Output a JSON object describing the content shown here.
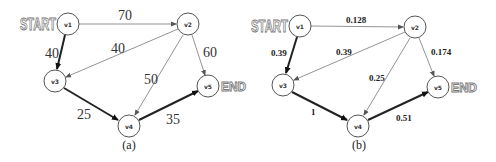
{
  "graphs": [
    {
      "id": "a",
      "caption": "(a)",
      "start_label": "START",
      "end_label": "END",
      "nodes": [
        {
          "id": "v1",
          "label": "v1",
          "x": 68,
          "y": 24
        },
        {
          "id": "v2",
          "label": "v2",
          "x": 188,
          "y": 24
        },
        {
          "id": "v3",
          "label": "v3",
          "x": 55,
          "y": 81
        },
        {
          "id": "v4",
          "label": "v4",
          "x": 129,
          "y": 126
        },
        {
          "id": "v5",
          "label": "v5",
          "x": 208,
          "y": 86
        }
      ],
      "edges": [
        {
          "from": "v1",
          "to": "v2",
          "weight": "70",
          "highlighted": false
        },
        {
          "from": "v1",
          "to": "v3",
          "weight": "40",
          "highlighted": true
        },
        {
          "from": "v2",
          "to": "v3",
          "weight": "40",
          "highlighted": false
        },
        {
          "from": "v2",
          "to": "v4",
          "weight": "50",
          "highlighted": false
        },
        {
          "from": "v2",
          "to": "v5",
          "weight": "60",
          "highlighted": false
        },
        {
          "from": "v3",
          "to": "v4",
          "weight": "25",
          "highlighted": true
        },
        {
          "from": "v4",
          "to": "v5",
          "weight": "35",
          "highlighted": true
        }
      ]
    },
    {
      "id": "b",
      "caption": "(b)",
      "start_label": "START",
      "end_label": "END",
      "nodes": [
        {
          "id": "v1",
          "label": "v1",
          "x": 300,
          "y": 26
        },
        {
          "id": "v2",
          "label": "v2",
          "x": 415,
          "y": 27
        },
        {
          "id": "v3",
          "label": "v3",
          "x": 283,
          "y": 85
        },
        {
          "id": "v4",
          "label": "v4",
          "x": 358,
          "y": 126
        },
        {
          "id": "v5",
          "label": "v5",
          "x": 438,
          "y": 87
        }
      ],
      "edges": [
        {
          "from": "v1",
          "to": "v2",
          "weight": "0.128",
          "highlighted": false
        },
        {
          "from": "v1",
          "to": "v3",
          "weight": "0.39",
          "highlighted": true
        },
        {
          "from": "v2",
          "to": "v3",
          "weight": "0.39",
          "highlighted": false
        },
        {
          "from": "v2",
          "to": "v4",
          "weight": "0.25",
          "highlighted": false
        },
        {
          "from": "v2",
          "to": "v5",
          "weight": "0.174",
          "highlighted": false
        },
        {
          "from": "v3",
          "to": "v4",
          "weight": "1",
          "highlighted": true
        },
        {
          "from": "v4",
          "to": "v5",
          "weight": "0.51",
          "highlighted": true
        }
      ]
    }
  ]
}
